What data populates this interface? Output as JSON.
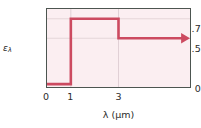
{
  "chart_data": {
    "type": "line",
    "title": "",
    "xlabel": "λ (μm)",
    "ylabel": "ε",
    "ylabel_sub": "λ",
    "xlim": [
      0,
      6
    ],
    "ylim": [
      0,
      0.8
    ],
    "grid": true,
    "legend": false,
    "xticks": [
      "0",
      "1",
      "3"
    ],
    "xtick_values": [
      0,
      1,
      3
    ],
    "yticks": [
      "0",
      "0.5",
      "0.7"
    ],
    "ytick_values": [
      0,
      0.5,
      0.7
    ],
    "series": [
      {
        "name": "spectral emissivity",
        "color": "#cc4a60",
        "step": "post",
        "arrow_end": true,
        "points": [
          {
            "x": 0,
            "y": 0.03
          },
          {
            "x": 1,
            "y": 0.03
          },
          {
            "x": 1,
            "y": 0.7
          },
          {
            "x": 3,
            "y": 0.7
          },
          {
            "x": 3,
            "y": 0.5
          },
          {
            "x": 6,
            "y": 0.5
          }
        ],
        "segments": [
          {
            "x_from": 0,
            "x_to": 1,
            "value": 0.03
          },
          {
            "x_from": 1,
            "x_to": 3,
            "value": 0.7
          },
          {
            "x_from": 3,
            "x_to": 6,
            "value": 0.5
          }
        ]
      }
    ]
  },
  "colors": {
    "curve": "#cc4a60",
    "plot_background": "#fbeef1",
    "axis": "#4c5550",
    "grid": "#e4d3d8",
    "text": "#2b2b2b"
  },
  "axes": {
    "y": {
      "label_main": "ε",
      "label_sub": "λ",
      "tick0": "0",
      "tick1": "0.5",
      "tick2": "0.7"
    },
    "x": {
      "label": "λ (μm)",
      "tick0": "0",
      "tick1": "1",
      "tick2": "3"
    }
  }
}
